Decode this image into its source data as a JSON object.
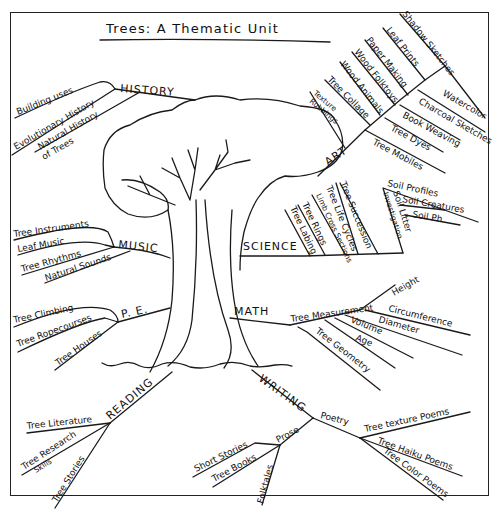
{
  "title": "Trees: A Thematic Unit",
  "colors": {
    "ink": "#1a1a1a",
    "paper": "#ffffff"
  },
  "center": {
    "label": "tree-drawing"
  },
  "hubs": {
    "history": {
      "label": "HISTORY",
      "items": [
        "Building uses",
        "Evolutionary History",
        "Natural History",
        "of Trees"
      ]
    },
    "art": {
      "label": "ART",
      "items": [
        "Shadow Sketches",
        "Leaf Prints",
        "Paper Making",
        "Wood Folktoys",
        "Wood Animals",
        "Tree Collage",
        "Texture",
        "Rubbings",
        "Watercolor",
        "Charcoal Sketches",
        "Book Weaving",
        "Tree Dyes",
        "Tree Mobiles"
      ]
    },
    "science": {
      "label": "SCIENCE",
      "items": [
        "Tree Labing",
        "Tree Rings",
        "Limb Cross Sections",
        "Tree Life Cycles",
        "Tree Succession",
        "Soil Litter",
        "Investigation",
        "Soil Profiles",
        "Soil Creatures",
        "Soil Ph"
      ]
    },
    "music": {
      "label": "MUSIC",
      "items": [
        "Tree Instruments",
        "Leaf Music",
        "Tree Rhythms",
        "Natural Sounds"
      ]
    },
    "pe": {
      "label": "P. E.",
      "items": [
        "Tree Climbing",
        "Tree Ropecourses",
        "Tree Houses"
      ]
    },
    "math": {
      "label": "MATH",
      "items": [
        "Tree Measurement",
        "Height",
        "Circumference",
        "Diameter",
        "Volume",
        "Age",
        "Tree Geometry"
      ]
    },
    "reading": {
      "label": "READING",
      "items": [
        "Tree Literature",
        "Tree Research",
        "Skills",
        "Tree Stories"
      ]
    },
    "writing": {
      "label": "WRITING",
      "sub": {
        "poetry": {
          "label": "Poetry",
          "items": [
            "Tree texture Poems",
            "Tree Haiku Poems",
            "Tree Color Poems"
          ]
        },
        "prose": {
          "label": "Prose",
          "items": [
            "Short Stories",
            "Tree Books",
            "Folktales"
          ]
        }
      }
    }
  }
}
